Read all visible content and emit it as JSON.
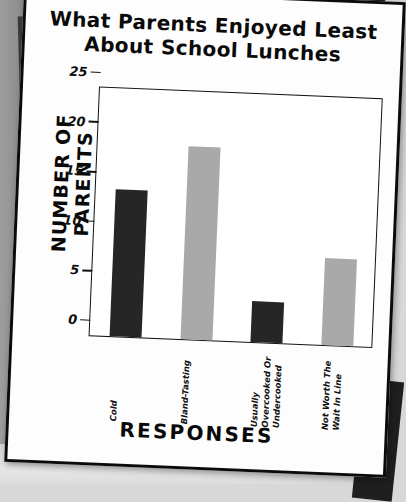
{
  "page": {
    "kind": "photographed-printed-chart-page",
    "background_color": "#e3e3e3",
    "paper_color": "#fdfdfd",
    "border_color": "#0b0b0b"
  },
  "chart_data": {
    "type": "bar",
    "title": "What Parents Enjoyed Least About School Lunches",
    "title_lines": [
      "What Parents Enjoyed Least",
      "About School Lunches"
    ],
    "xlabel": "RESPONSES",
    "ylabel": "NUMBER OF PARENTS",
    "categories": [
      "Cold",
      "Bland-Tasting",
      "Usually Overcooked Or Undercooked",
      "Not Worth The Wait In Line"
    ],
    "category_label_lines": [
      [
        "Cold"
      ],
      [
        "Bland-Tasting"
      ],
      [
        "Usually",
        "Overcooked Or",
        "Undercooked"
      ],
      [
        "Not Worth The",
        "Wait In Line"
      ]
    ],
    "values": [
      14.8,
      19.5,
      4.1,
      8.8
    ],
    "bar_colors": [
      "#262626",
      "#a9a9a9",
      "#262626",
      "#a9a9a9"
    ],
    "ylim": [
      0,
      25
    ],
    "ytick_values": [
      0,
      5,
      10,
      15,
      20,
      25
    ],
    "ytick_labels": [
      "0",
      "5",
      "10",
      "15",
      "20",
      "25"
    ],
    "grid": false,
    "legend": false
  }
}
